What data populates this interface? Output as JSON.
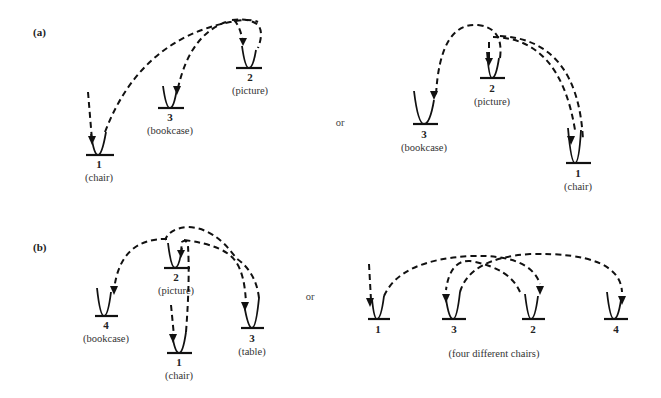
{
  "panels": {
    "a": {
      "label": "(a)",
      "left": {
        "nodes": [
          {
            "num": "1",
            "name": "(chair)"
          },
          {
            "num": "3",
            "name": "(bookcase)"
          },
          {
            "num": "2",
            "name": "(picture)"
          }
        ]
      },
      "connector": "or",
      "right": {
        "nodes": [
          {
            "num": "3",
            "name": "(bookcase)"
          },
          {
            "num": "2",
            "name": "(picture)"
          },
          {
            "num": "1",
            "name": "(chair)"
          }
        ]
      }
    },
    "b": {
      "label": "(b)",
      "left": {
        "nodes": [
          {
            "num": "4",
            "name": "(bookcase)"
          },
          {
            "num": "2",
            "name": "(picture)"
          },
          {
            "num": "1",
            "name": "(chair)"
          },
          {
            "num": "3",
            "name": "(table)"
          }
        ]
      },
      "connector": "or",
      "right": {
        "nodes": [
          {
            "num": "1"
          },
          {
            "num": "3"
          },
          {
            "num": "2"
          },
          {
            "num": "4"
          }
        ],
        "caption": "(four different chairs)"
      }
    }
  }
}
